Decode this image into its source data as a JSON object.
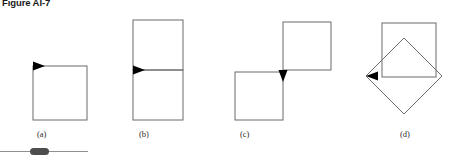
{
  "figure": {
    "title": "Figure AI-7",
    "stroke_color": "#6b6b6b",
    "arrow_color": "#000000",
    "background_color": "#ffffff",
    "footer_rule_color": "#8f8f8f",
    "footer_pill_color": "#4d4d4d"
  },
  "panels": [
    {
      "id": "a",
      "caption": "(a)",
      "caption_x": 37,
      "caption_y": 137,
      "description": "single square with right-pointing arrowhead at top-left corner",
      "arrow_direction": "right",
      "shapes": [
        {
          "kind": "square",
          "x": 33,
          "y": 66,
          "size": 54
        }
      ],
      "arrow": {
        "x": 33,
        "y": 66,
        "direction": "right"
      }
    },
    {
      "id": "b",
      "caption": "(b)",
      "caption_x": 139,
      "caption_y": 137,
      "description": "two stacked squares forming a vertical rectangle, right-pointing arrowhead at mid-left where the shared edge meets",
      "arrow_direction": "right",
      "shapes": [
        {
          "kind": "square",
          "x": 133,
          "y": 20,
          "size": 50
        },
        {
          "kind": "square",
          "x": 133,
          "y": 70,
          "size": 50
        }
      ],
      "arrow": {
        "x": 133,
        "y": 70,
        "direction": "right"
      }
    },
    {
      "id": "c",
      "caption": "(c)",
      "caption_x": 240,
      "caption_y": 137,
      "description": "two squares offset diagonally, upper-right and lower-left, touching at one corner with a downward-pointing arrowhead at the junction",
      "arrow_direction": "down",
      "shapes": [
        {
          "kind": "square",
          "x": 283,
          "y": 22,
          "size": 48
        },
        {
          "kind": "square",
          "x": 235,
          "y": 73,
          "size": 48
        }
      ],
      "arrow": {
        "x": 283,
        "y": 73,
        "direction": "down"
      }
    },
    {
      "id": "d",
      "caption": "(d)",
      "caption_x": 400,
      "caption_y": 137,
      "description": "an axis-aligned square overlapping a 45-degree rotated square (diamond), left-pointing arrowhead at the diamond's left vertex",
      "arrow_direction": "left",
      "shapes": [
        {
          "kind": "square",
          "x": 382,
          "y": 23,
          "size": 54
        },
        {
          "kind": "diamond",
          "cx": 404,
          "cy": 76,
          "radius": 38
        }
      ],
      "arrow": {
        "x": 366,
        "y": 76,
        "direction": "left"
      }
    }
  ]
}
